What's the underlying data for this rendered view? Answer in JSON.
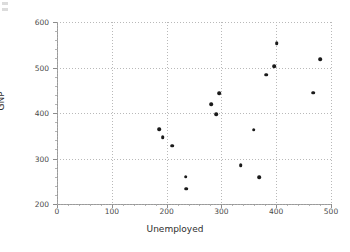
{
  "chart_data": {
    "type": "scatter",
    "title": "",
    "xlabel": "Unemployed",
    "ylabel": "GNP",
    "xlim": [
      0,
      500
    ],
    "ylim": [
      200,
      600
    ],
    "grid": true,
    "legend": null,
    "xticks": [
      0,
      100,
      200,
      300,
      400,
      500
    ],
    "yticks": [
      200,
      300,
      400,
      500,
      600
    ],
    "xtick_labels": [
      "0",
      "100",
      "200",
      "300",
      "400",
      "500"
    ],
    "ytick_labels": [
      "200",
      "300",
      "400",
      "500",
      "600"
    ],
    "marker": "filled-circle",
    "marker_color": "#1a1a1a",
    "points": [
      {
        "x": 187,
        "y": 365
      },
      {
        "x": 193,
        "y": 347
      },
      {
        "x": 210,
        "y": 328
      },
      {
        "x": 235,
        "y": 260
      },
      {
        "x": 236,
        "y": 234
      },
      {
        "x": 281,
        "y": 419
      },
      {
        "x": 291,
        "y": 398
      },
      {
        "x": 296,
        "y": 443
      },
      {
        "x": 335,
        "y": 285
      },
      {
        "x": 359,
        "y": 363
      },
      {
        "x": 369,
        "y": 259
      },
      {
        "x": 382,
        "y": 484
      },
      {
        "x": 396,
        "y": 503
      },
      {
        "x": 401,
        "y": 554
      },
      {
        "x": 468,
        "y": 445
      },
      {
        "x": 480,
        "y": 518
      }
    ]
  },
  "axes": {
    "x_axis_name": "unemployed-axis",
    "y_axis_name": "gnp-axis"
  }
}
